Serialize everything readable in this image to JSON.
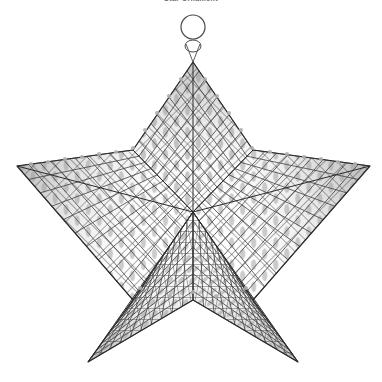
{
  "document": {
    "title": "Star Mesh Ornament",
    "caption": "Star Ornament",
    "background_color": "#ffffff"
  },
  "figure": {
    "name": "wire-mesh-star-ornament",
    "view": "three-quarter perspective",
    "width": 382,
    "height": 382
  },
  "style": {
    "mesh_line_color": "#3c3c3c",
    "outline_color": "#2b2b2b",
    "facet_shade_color": "#9a9a9a",
    "facet_shade_light": "#c4c4c4",
    "background_color": "#ffffff",
    "ring_stroke_color": "#4a4a4a",
    "mesh_line_width": 0.85,
    "outline_width": 1.1
  },
  "geometry": {
    "center": {
      "x": 193,
      "y": 212
    },
    "outer_radius": 152,
    "inner_radius": 63,
    "points": 5,
    "rotation_deg": -90,
    "outer_vertices": [
      {
        "name": "apex-top",
        "x": 193,
        "y": 62
      },
      {
        "name": "tip-right",
        "x": 370,
        "y": 166
      },
      {
        "name": "tip-bottom-right",
        "x": 298,
        "y": 362
      },
      {
        "name": "tip-bottom-left",
        "x": 88,
        "y": 362
      },
      {
        "name": "tip-left",
        "x": 17,
        "y": 166
      }
    ],
    "inner_vertices": [
      {
        "name": "notch-upper-right",
        "x": 253,
        "y": 150
      },
      {
        "name": "notch-lower-right",
        "x": 253,
        "y": 300
      },
      {
        "name": "notch-bottom",
        "x": 193,
        "y": 300
      },
      {
        "name": "notch-lower-left",
        "x": 133,
        "y": 300
      },
      {
        "name": "notch-upper-left",
        "x": 133,
        "y": 150
      }
    ]
  },
  "ring": {
    "name": "hanging-ring",
    "center_x": 193,
    "center_y": 27,
    "radius": 12,
    "stroke_width": 1.2,
    "collar_center_x": 193,
    "collar_center_y": 45,
    "collar_rx": 7,
    "collar_ry": 5
  },
  "mesh": {
    "type": "square-grid",
    "rows": 22,
    "cols": 22,
    "cell_size_px": 11,
    "orientation": "diagonal-on-upper-facets, orthogonal-on-lower-facets",
    "shaded_cells_note": "Gray lens/diamond fills mark the angled wire crossings catching light along the facet folds."
  },
  "facets": [
    {
      "id": 1,
      "name": "facet-top",
      "shade": "light",
      "label": "upper point panel"
    },
    {
      "id": 2,
      "name": "facet-right",
      "shade": "mid",
      "label": "right point panel"
    },
    {
      "id": 3,
      "name": "facet-bottom-right",
      "shade": "dark",
      "label": "lower right point panel"
    },
    {
      "id": 4,
      "name": "facet-bottom-left",
      "shade": "dark",
      "label": "lower left point panel"
    },
    {
      "id": 5,
      "name": "facet-left",
      "shade": "mid",
      "label": "left point panel"
    }
  ]
}
